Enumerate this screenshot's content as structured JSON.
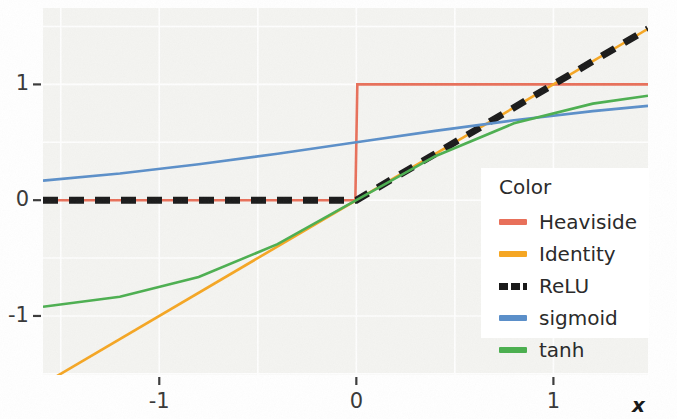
{
  "chart_data": {
    "type": "line",
    "title": "",
    "xlabel": "x",
    "ylabel": "",
    "xlim": [
      -1.59,
      1.48
    ],
    "ylim": [
      -1.51,
      1.66
    ],
    "xticks": [
      "-1",
      "0",
      "1"
    ],
    "xtick_values": [
      -1,
      0,
      1
    ],
    "yticks": [
      "1",
      "0",
      "-1"
    ],
    "ytick_values": [
      1,
      0,
      -1
    ],
    "grid": true,
    "legend_position": "right-inside",
    "legend_title": "Color",
    "series": [
      {
        "name": "Heaviside",
        "color": "#e8705a",
        "style": "solid",
        "x": [
          -1.59,
          -0.005,
          0.005,
          1.48
        ],
        "values": [
          0,
          0,
          1,
          1
        ]
      },
      {
        "name": "Identity",
        "color": "#f5a623",
        "style": "solid",
        "x": [
          -1.59,
          1.48
        ],
        "values": [
          -1.59,
          1.48
        ]
      },
      {
        "name": "ReLU",
        "color": "#1a1a1a",
        "style": "dashed",
        "x": [
          -1.59,
          0,
          1.48
        ],
        "values": [
          0,
          0,
          1.48
        ]
      },
      {
        "name": "sigmoid",
        "color": "#5b8fc9",
        "style": "solid",
        "x": [
          -1.59,
          -1.2,
          -0.8,
          -0.4,
          0,
          0.4,
          0.8,
          1.2,
          1.48
        ],
        "values": [
          0.169,
          0.231,
          0.31,
          0.401,
          0.5,
          0.599,
          0.69,
          0.769,
          0.815
        ]
      },
      {
        "name": "tanh",
        "color": "#4caf50",
        "style": "solid",
        "x": [
          -1.59,
          -1.2,
          -0.8,
          -0.4,
          0,
          0.4,
          0.8,
          1.2,
          1.48
        ],
        "values": [
          -0.92,
          -0.834,
          -0.664,
          -0.38,
          0,
          0.38,
          0.664,
          0.834,
          0.902
        ]
      }
    ]
  },
  "axes": {
    "x_axis_label": "x"
  },
  "legend": {
    "title": "Color",
    "entries": [
      {
        "label": "Heaviside",
        "color": "#e8705a",
        "style": "solid"
      },
      {
        "label": "Identity",
        "color": "#f5a623",
        "style": "solid"
      },
      {
        "label": "ReLU",
        "color": "#1a1a1a",
        "style": "dashed"
      },
      {
        "label": "sigmoid",
        "color": "#5b8fc9",
        "style": "solid"
      },
      {
        "label": "tanh",
        "color": "#4caf50",
        "style": "solid"
      }
    ]
  },
  "colors": {
    "plot_background": "#f4f4f1",
    "page_background": "#ffffff",
    "grid": "#ffffff",
    "text": "#2b2b2b"
  }
}
